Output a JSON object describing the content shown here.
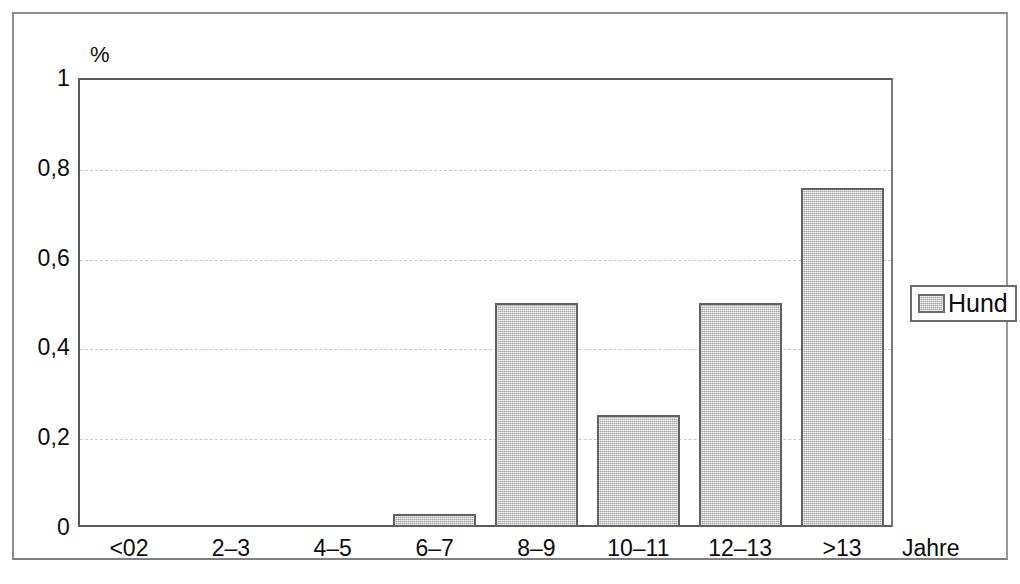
{
  "chart_data": {
    "type": "bar",
    "title": "",
    "subtitle": "",
    "xlabel": "Jahre",
    "ylabel": "%",
    "categories": [
      "<02",
      "2–3",
      "4–5",
      "6–7",
      "8–9",
      "10–11",
      "12–13",
      ">13"
    ],
    "series": [
      {
        "name": "Hund",
        "values": [
          0,
          0,
          0,
          0.03,
          0.5,
          0.25,
          0.5,
          0.755
        ]
      }
    ],
    "values": [
      0,
      0,
      0,
      0.03,
      0.5,
      0.25,
      0.5,
      0.755
    ],
    "ylim": [
      0,
      1
    ],
    "ytick_labels": [
      "0",
      "0,2",
      "0,4",
      "0,6",
      "0,8",
      "1"
    ],
    "ytick_values": [
      0,
      0.2,
      0.4,
      0.6,
      0.8,
      1
    ],
    "grid": true,
    "grid_axis": "y",
    "legend": {
      "position": "right-outside",
      "entries": [
        {
          "label": "Hund",
          "color": "#c0c0c0"
        }
      ]
    },
    "colors": {
      "bar_fill": "#c0c0c0",
      "bar_border": "#616161",
      "gridline": "#c9c9c9",
      "axis": "#5a5a5a",
      "frame": "#8d8d8d",
      "text": "#0d0d0d",
      "background": "#ffffff"
    }
  }
}
